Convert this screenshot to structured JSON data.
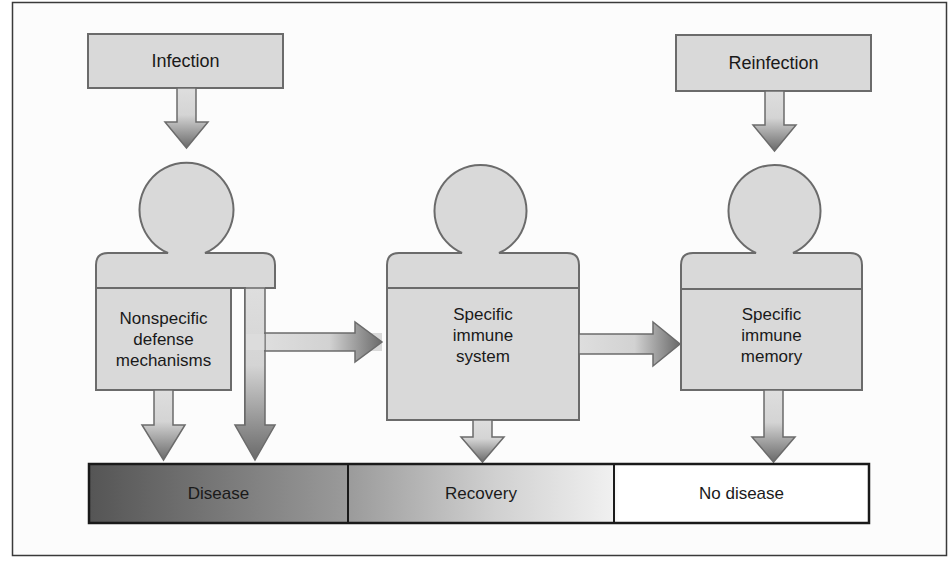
{
  "diagram": {
    "colors": {
      "box_fill": "#d9d9d9",
      "box_stroke": "#6b6b6b",
      "arrow_light": "#e0e0e0",
      "arrow_dark": "#6e6e6e",
      "disease_dark": "#5a5a5a",
      "recovery": "#c8c8c8",
      "no_disease": "#ffffff",
      "frame": "#3a3a3a"
    },
    "top_boxes": {
      "infection": "Infection",
      "reinfection": "Reinfection"
    },
    "persons": [
      {
        "id": "nonspecific",
        "lines": [
          "Nonspecific",
          "defense",
          "mechanisms"
        ]
      },
      {
        "id": "specific-system",
        "lines": [
          "Specific",
          "immune",
          "system"
        ]
      },
      {
        "id": "specific-memory",
        "lines": [
          "Specific",
          "immune",
          "memory"
        ]
      }
    ],
    "outcome_bar": {
      "segments": [
        {
          "label": "Disease"
        },
        {
          "label": "Recovery"
        },
        {
          "label": "No disease"
        }
      ]
    },
    "edges": [
      {
        "from": "Infection",
        "to": "Nonspecific defense mechanisms"
      },
      {
        "from": "Nonspecific defense mechanisms",
        "to": "Disease"
      },
      {
        "from": "Nonspecific defense mechanisms",
        "to": "Disease (bypass channel)"
      },
      {
        "from": "Nonspecific defense mechanisms",
        "to": "Specific immune system"
      },
      {
        "from": "Specific immune system",
        "to": "Recovery"
      },
      {
        "from": "Specific immune system",
        "to": "Specific immune memory"
      },
      {
        "from": "Reinfection",
        "to": "Specific immune memory"
      },
      {
        "from": "Specific immune memory",
        "to": "No disease"
      }
    ]
  }
}
